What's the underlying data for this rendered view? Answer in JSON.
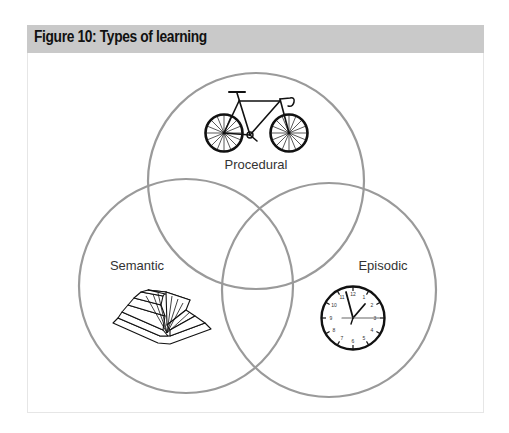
{
  "figure": {
    "title": "Figure 10: Types of learning",
    "header_color": "#c9c9c9"
  },
  "venn": {
    "circle_stroke": "#9a9a9a",
    "sets": [
      {
        "id": "procedural",
        "label": "Procedural",
        "icon": "bicycle-icon"
      },
      {
        "id": "semantic",
        "label": "Semantic",
        "icon": "open-book-icon"
      },
      {
        "id": "episodic",
        "label": "Episodic",
        "icon": "clock-icon"
      }
    ],
    "clock_numbers": [
      "12",
      "1",
      "2",
      "3",
      "4",
      "5",
      "6",
      "7",
      "8",
      "9",
      "10",
      "11"
    ]
  }
}
